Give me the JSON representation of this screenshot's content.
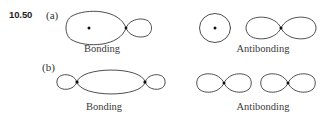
{
  "figure": {
    "problem_number": "10.50",
    "background_color": "#ffffff",
    "stroke_color": "#2e2e2e",
    "nucleus_color": "#111111",
    "parts": [
      {
        "part_label": "(a)",
        "bonding_caption": "Bonding",
        "antibonding_caption": "Antibonding",
        "bonding_description": "large-lobe-with-nucleus joined to small lobe at node",
        "antibonding_description": "separate circle with nucleus plus two-lobe p orbital with nucleus"
      },
      {
        "part_label": "(b)",
        "bonding_caption": "Bonding",
        "antibonding_caption": "Antibonding",
        "bonding_description": "central ellipse flanked by two small outer lobes with two nuclei",
        "antibonding_description": "two separate two-lobe p orbitals each with a nucleus"
      }
    ],
    "captions": {
      "a_bonding": "Bonding",
      "a_antibonding": "Antibonding",
      "b_bonding": "Bonding",
      "b_antibonding": "Antibonding"
    },
    "part_labels": {
      "a": "(a)",
      "b": "(b)"
    },
    "icons": {
      "nucleus": "nucleus-dot"
    }
  }
}
